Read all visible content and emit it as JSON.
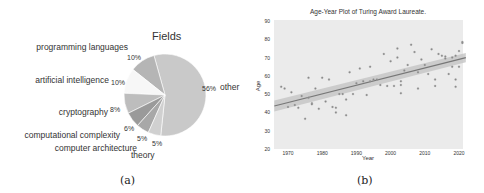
{
  "chart_data": [
    {
      "type": "pie",
      "title": "Fields",
      "caption": "(a)",
      "start_angle_deg": -96,
      "direction": "counterclockwise",
      "slices": [
        {
          "label": "other",
          "pct_label": "56%",
          "value": 56,
          "color": "#c9c9c9"
        },
        {
          "label": "programming languages",
          "pct_label": "10%",
          "value": 10,
          "color": "#b5b5b5"
        },
        {
          "label": "artificial intelligence",
          "pct_label": "10%",
          "value": 10,
          "color": "#f7f7f7"
        },
        {
          "label": "cryptography",
          "pct_label": "8%",
          "value": 8,
          "color": "#bdbdbd"
        },
        {
          "label": "computational complexity",
          "pct_label": "6%",
          "value": 6,
          "color": "#9a9a9a"
        },
        {
          "label": "computer architecture",
          "pct_label": "5%",
          "value": 5,
          "color": "#a8a8a8"
        },
        {
          "label": "theory",
          "pct_label": "5%",
          "value": 5,
          "color": "#d0d0d0"
        }
      ]
    },
    {
      "type": "scatter",
      "title": "Age-Year Plot of Turing Award Laureate.",
      "caption": "(b)",
      "xlabel": "Year",
      "ylabel": "Age",
      "xlim": [
        1966,
        2022
      ],
      "ylim": [
        20,
        90
      ],
      "xticks": [
        1970,
        1980,
        1990,
        2000,
        2010,
        2020
      ],
      "yticks": [
        20,
        30,
        40,
        50,
        60,
        70,
        80,
        90
      ],
      "grid": false,
      "background": "#ebebeb",
      "regression": {
        "x": [
          1967,
          2021
        ],
        "y": [
          44,
          69.5
        ],
        "ci_halfwidth": [
          3,
          2.5
        ],
        "color": "#777777"
      },
      "points": [
        [
          1968,
          54
        ],
        [
          1969,
          53
        ],
        [
          1970,
          43
        ],
        [
          1971,
          51
        ],
        [
          1972,
          44
        ],
        [
          1973,
          42.5
        ],
        [
          1974,
          49
        ],
        [
          1975,
          36.5
        ],
        [
          1976,
          59
        ],
        [
          1976,
          48
        ],
        [
          1977,
          45
        ],
        [
          1977,
          44.5
        ],
        [
          1978,
          53
        ],
        [
          1979,
          42
        ],
        [
          1980,
          59
        ],
        [
          1981,
          46
        ],
        [
          1982,
          58
        ],
        [
          1983,
          43
        ],
        [
          1984,
          42.5
        ],
        [
          1984,
          40
        ],
        [
          1985,
          50
        ],
        [
          1986,
          50
        ],
        [
          1987,
          47
        ],
        [
          1987,
          38.5
        ],
        [
          1988,
          62
        ],
        [
          1989,
          50
        ],
        [
          1990,
          56
        ],
        [
          1991,
          64
        ],
        [
          1992,
          57
        ],
        [
          1993,
          49.5
        ],
        [
          1994,
          65
        ],
        [
          1994,
          57
        ],
        [
          1995,
          58
        ],
        [
          1996,
          58
        ],
        [
          1997,
          55
        ],
        [
          1998,
          72
        ],
        [
          1999,
          54.5
        ],
        [
          2000,
          68
        ],
        [
          2001,
          54.5
        ],
        [
          2002,
          75
        ],
        [
          2002,
          70
        ],
        [
          2003,
          57
        ],
        [
          2003,
          55
        ],
        [
          2003,
          50.5
        ],
        [
          2004,
          63
        ],
        [
          2005,
          66
        ],
        [
          2006,
          77
        ],
        [
          2007,
          73
        ],
        [
          2008,
          62
        ],
        [
          2008,
          53
        ],
        [
          2009,
          69
        ],
        [
          2010,
          66
        ],
        [
          2011,
          61
        ],
        [
          2012,
          74.5
        ],
        [
          2013,
          58
        ],
        [
          2013,
          54.5
        ],
        [
          2014,
          72
        ],
        [
          2015,
          71
        ],
        [
          2016,
          70.5
        ],
        [
          2016,
          69.5
        ],
        [
          2017,
          61
        ],
        [
          2018,
          70
        ],
        [
          2018,
          65
        ],
        [
          2019,
          71
        ],
        [
          2019,
          58
        ],
        [
          2019,
          54
        ],
        [
          2020,
          73.5
        ],
        [
          2020,
          65
        ],
        [
          2021,
          78.5
        ],
        [
          2021,
          78
        ]
      ]
    }
  ]
}
